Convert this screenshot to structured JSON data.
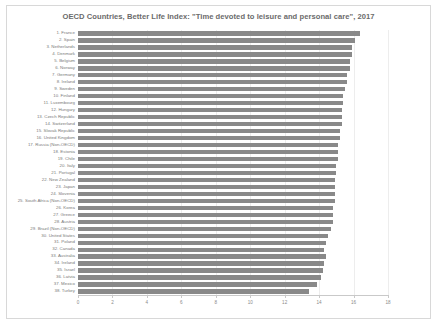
{
  "chart": {
    "title": "OECD Countries, Better Life Index: \"Time devoted to leisure and personal care\", 2017",
    "bar_color": "#898989",
    "frame_color": "#d8d8d8"
  },
  "chart_data": {
    "type": "bar",
    "orientation": "horizontal",
    "title": "OECD Countries, Better Life Index: \"Time devoted to leisure and personal care\", 2017",
    "xlabel": "",
    "ylabel": "",
    "xlim": [
      0,
      18
    ],
    "grid": true,
    "legend": "none",
    "xticks": [
      0,
      2,
      4,
      6,
      8,
      10,
      12,
      14,
      16,
      18
    ],
    "xtick_labels": [
      "0",
      "2",
      "4",
      "6",
      "8",
      "10",
      "12",
      "14",
      "16",
      "18"
    ],
    "categories": [
      "1. France",
      "2. Spain",
      "3. Netherlands",
      "4. Denmark",
      "5. Belgium",
      "6. Norway",
      "7. Germany",
      "8. Ireland",
      "9. Sweden",
      "10. Finland",
      "11. Luxembourg",
      "12. Hungary",
      "13. Czech Republic",
      "14. Switzerland",
      "15. Slovak Republic",
      "16. United Kingdom",
      "17. Russia (Non-OECD)",
      "18. Estonia",
      "19. Chile",
      "20. Italy",
      "21. Portugal",
      "22. New Zealand",
      "23. Japan",
      "24. Slovenia",
      "25. South Africa (Non-OECD)",
      "26. Korea",
      "27. Greece",
      "28. Austria",
      "29. Brazil (Non-OECD)",
      "30. United States",
      "31. Poland",
      "32. Canada",
      "33. Australia",
      "34. Ireland",
      "35. Israel",
      "36. Latvia",
      "37. Mexico",
      "38. Turkey"
    ],
    "values": [
      16.4,
      16.1,
      15.9,
      15.9,
      15.8,
      15.8,
      15.6,
      15.6,
      15.5,
      15.4,
      15.4,
      15.3,
      15.3,
      15.3,
      15.2,
      15.2,
      15.1,
      15.1,
      15.1,
      15.0,
      15.0,
      14.9,
      14.9,
      14.9,
      14.9,
      14.8,
      14.8,
      14.8,
      14.7,
      14.5,
      14.4,
      14.3,
      14.4,
      14.3,
      14.2,
      14.1,
      13.9,
      13.4
    ]
  }
}
